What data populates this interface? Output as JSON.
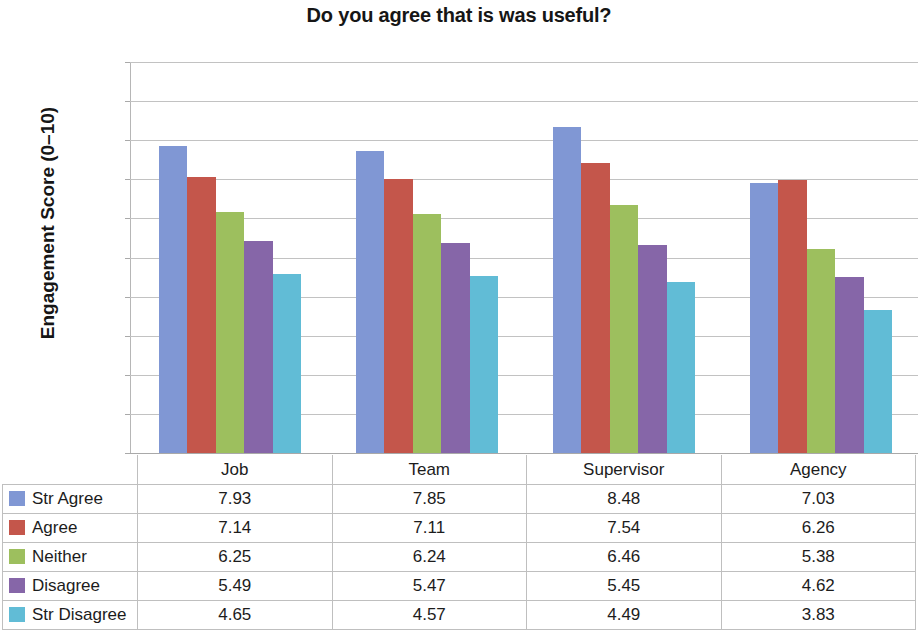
{
  "chart_data": {
    "type": "bar",
    "title": "Do you agree that is was useful?",
    "xlabel": "",
    "ylabel": "Engagement Score (0–10)",
    "ylim": [
      0,
      10
    ],
    "ytick_labels": [
      "10.00",
      "9.00",
      "8.00",
      "7.00",
      "6.00",
      "5.00",
      "4.00",
      "3.00",
      "2.00",
      "1.00",
      "0.00"
    ],
    "ytick_values": [
      10,
      9,
      8,
      7,
      6,
      5,
      4,
      3,
      2,
      1,
      0
    ],
    "grid": true,
    "legend_position": "data-table-left",
    "categories": [
      "Job",
      "Team",
      "Supervisor",
      "Agency"
    ],
    "series": [
      {
        "name": "Str Agree",
        "color": "#8097d4",
        "values": [
          7.93,
          7.85,
          8.48,
          7.03
        ],
        "plotted": [
          7.85,
          7.72,
          8.35,
          6.9
        ]
      },
      {
        "name": "Agree",
        "color": "#c4564b",
        "values": [
          7.14,
          7.11,
          7.54,
          6.26
        ],
        "plotted": [
          7.05,
          7.0,
          7.42,
          6.97
        ]
      },
      {
        "name": "Neither",
        "color": "#9dbf5e",
        "values": [
          6.25,
          6.24,
          6.46,
          5.38
        ],
        "plotted": [
          6.16,
          6.12,
          6.34,
          5.22
        ]
      },
      {
        "name": "Disagree",
        "color": "#8666a8",
        "values": [
          5.49,
          5.47,
          5.45,
          4.62
        ],
        "plotted": [
          5.42,
          5.37,
          5.32,
          4.5
        ]
      },
      {
        "name": "Str Disagree",
        "color": "#61bcd6",
        "values": [
          4.65,
          4.57,
          4.49,
          3.83
        ],
        "plotted": [
          4.59,
          4.52,
          4.38,
          3.67
        ]
      }
    ]
  },
  "table": {
    "corner_label": "",
    "column_headers": [
      "Job",
      "Team",
      "Supervisor",
      "Agency"
    ],
    "rows": [
      {
        "label": "Str Agree",
        "swatch": "#8097d4",
        "values": [
          "7.93",
          "7.85",
          "8.48",
          "7.03"
        ]
      },
      {
        "label": "Agree",
        "swatch": "#c4564b",
        "values": [
          "7.14",
          "7.11",
          "7.54",
          "6.26"
        ]
      },
      {
        "label": "Neither",
        "swatch": "#9dbf5e",
        "values": [
          "6.25",
          "6.24",
          "6.46",
          "5.38"
        ]
      },
      {
        "label": "Disagree",
        "swatch": "#8666a8",
        "values": [
          "5.49",
          "5.47",
          "5.45",
          "4.62"
        ]
      },
      {
        "label": "Str Disagree",
        "swatch": "#61bcd6",
        "values": [
          "4.65",
          "4.57",
          "4.49",
          "3.83"
        ]
      }
    ]
  }
}
